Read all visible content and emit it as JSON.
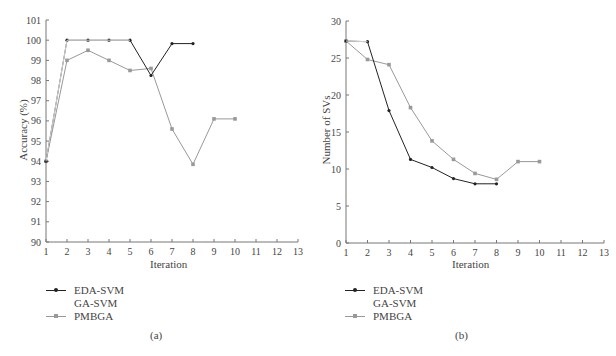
{
  "chart_data": [
    {
      "type": "line",
      "panel_label": "(a)",
      "title": "",
      "xlabel": "Iteration",
      "ylabel": "Accuracy (%)",
      "xlim": [
        1,
        13
      ],
      "ylim": [
        90,
        101
      ],
      "x_ticks": [
        1,
        2,
        3,
        4,
        5,
        6,
        7,
        8,
        9,
        10,
        11,
        12,
        13
      ],
      "y_ticks": [
        90,
        91,
        92,
        93,
        94,
        95,
        96,
        97,
        98,
        99,
        100,
        101
      ],
      "grid": false,
      "legend_position": "below",
      "series": [
        {
          "name": "EDA-SVM",
          "color": "#222222",
          "marker": "dot",
          "x": [
            1,
            2,
            3,
            4,
            5,
            6,
            7,
            8
          ],
          "values": [
            94,
            100,
            100,
            100,
            100,
            98.25,
            99.83,
            99.83
          ]
        },
        {
          "name": "GA-SVM",
          "color": "#ffffff",
          "marker": "none",
          "x": [
            1,
            2,
            3,
            4,
            5
          ],
          "values": [
            94,
            100,
            100,
            100,
            100
          ]
        },
        {
          "name": "PMBGA",
          "color": "#999999",
          "marker": "square",
          "x": [
            1,
            2,
            3,
            4,
            5,
            6,
            7,
            8,
            9,
            10
          ],
          "values": [
            94,
            99,
            99.5,
            99,
            98.5,
            98.6,
            95.6,
            93.85,
            96.1,
            96.1
          ]
        }
      ]
    },
    {
      "type": "line",
      "panel_label": "(b)",
      "title": "",
      "xlabel": "Iteration",
      "ylabel": "Number of SVs",
      "xlim": [
        1,
        13
      ],
      "ylim": [
        0,
        30
      ],
      "x_ticks": [
        1,
        2,
        3,
        4,
        5,
        6,
        7,
        8,
        9,
        10,
        11,
        12,
        13
      ],
      "y_ticks": [
        0,
        5,
        10,
        15,
        20,
        25,
        30
      ],
      "grid": false,
      "legend_position": "below",
      "series": [
        {
          "name": "EDA-SVM",
          "color": "#222222",
          "marker": "dot",
          "x": [
            1,
            2,
            3,
            4,
            5,
            6,
            7,
            8
          ],
          "values": [
            27.3,
            27.2,
            17.9,
            11.3,
            10.2,
            8.7,
            8.0,
            8.0
          ]
        },
        {
          "name": "GA-SVM",
          "color": "#ffffff",
          "marker": "none",
          "x": [
            1,
            2
          ],
          "values": [
            27.3,
            27.2
          ]
        },
        {
          "name": "PMBGA",
          "color": "#999999",
          "marker": "square",
          "x": [
            1,
            2,
            3,
            4,
            5,
            6,
            7,
            8,
            9,
            10
          ],
          "values": [
            27.3,
            24.8,
            24.1,
            18.3,
            13.8,
            11.3,
            9.4,
            8.6,
            11.0,
            11.0
          ]
        }
      ]
    }
  ],
  "panels": [
    {
      "caption": "(a)",
      "xlabel": "Iteration",
      "ylabel": "Accuracy (%)",
      "legend": [
        {
          "label": "EDA-SVM"
        },
        {
          "label": "GA-SVM"
        },
        {
          "label": "PMBGA"
        }
      ]
    },
    {
      "caption": "(b)",
      "xlabel": "Iteration",
      "ylabel": "Number of SVs",
      "legend": [
        {
          "label": "EDA-SVM"
        },
        {
          "label": "GA-SVM"
        },
        {
          "label": "PMBGA"
        }
      ]
    }
  ]
}
